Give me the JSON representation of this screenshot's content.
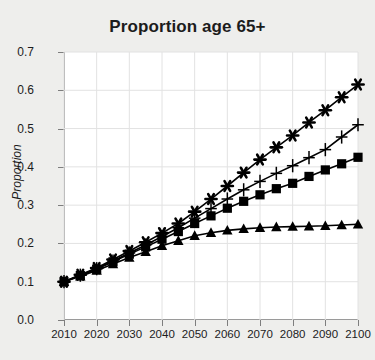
{
  "chart_data": {
    "type": "line",
    "title": "Proportion age 65+",
    "xlabel": "",
    "ylabel": "Proportion",
    "xlim": [
      2010,
      2100
    ],
    "ylim": [
      0.0,
      0.7
    ],
    "grid": true,
    "legend": "none",
    "x_ticks": [
      "2010",
      "2020",
      "2030",
      "2040",
      "2050",
      "2060",
      "2070",
      "2080",
      "2090",
      "2100"
    ],
    "y_ticks": [
      "0.0",
      "0.1",
      "0.2",
      "0.3",
      "0.4",
      "0.5",
      "0.6",
      "0.7"
    ],
    "x": [
      2010,
      2015,
      2020,
      2025,
      2030,
      2035,
      2040,
      2045,
      2050,
      2055,
      2060,
      2065,
      2070,
      2075,
      2080,
      2085,
      2090,
      2095,
      2100
    ],
    "series": [
      {
        "name": "series-asterisk",
        "marker": "asterisk",
        "color": "#000000",
        "values": [
          0.1,
          0.118,
          0.136,
          0.158,
          0.18,
          0.203,
          0.227,
          0.252,
          0.283,
          0.316,
          0.35,
          0.385,
          0.419,
          0.451,
          0.482,
          0.516,
          0.548,
          0.582,
          0.615
        ]
      },
      {
        "name": "series-plus",
        "marker": "plus",
        "color": "#000000",
        "values": [
          0.1,
          0.117,
          0.134,
          0.154,
          0.175,
          0.196,
          0.218,
          0.241,
          0.266,
          0.291,
          0.316,
          0.34,
          0.362,
          0.383,
          0.403,
          0.424,
          0.445,
          0.478,
          0.51
        ]
      },
      {
        "name": "series-square",
        "marker": "square",
        "color": "#000000",
        "values": [
          0.1,
          0.116,
          0.133,
          0.152,
          0.172,
          0.191,
          0.211,
          0.231,
          0.252,
          0.272,
          0.292,
          0.31,
          0.327,
          0.343,
          0.357,
          0.375,
          0.392,
          0.408,
          0.425
        ]
      },
      {
        "name": "series-triangle",
        "marker": "triangle",
        "color": "#000000",
        "values": [
          0.1,
          0.114,
          0.129,
          0.146,
          0.163,
          0.178,
          0.194,
          0.207,
          0.22,
          0.228,
          0.234,
          0.238,
          0.241,
          0.243,
          0.244,
          0.245,
          0.246,
          0.248,
          0.25
        ]
      }
    ]
  }
}
